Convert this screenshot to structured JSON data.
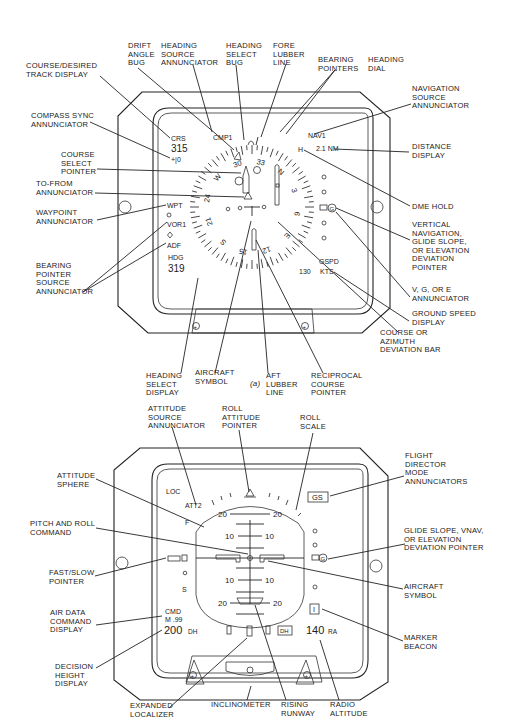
{
  "figure_a": {
    "caption": "(a)",
    "title": "Horizontal Situation Indicator",
    "callouts": [
      {
        "id": "course-desired-track-display",
        "lines": [
          "COURSE/DESIRED",
          "TRACK DISPLAY"
        ]
      },
      {
        "id": "drift-angle-bug",
        "lines": [
          "DRIFT",
          "ANGLE",
          "BUG"
        ]
      },
      {
        "id": "heading-source-annunciator",
        "lines": [
          "HEADING",
          "SOURCE",
          "ANNUNCIATOR"
        ]
      },
      {
        "id": "heading-select-bug",
        "lines": [
          "HEADING",
          "SELECT",
          "BUG"
        ]
      },
      {
        "id": "fore-lubber-line",
        "lines": [
          "FORE",
          "LUBBER",
          "LINE"
        ]
      },
      {
        "id": "bearing-pointers",
        "lines": [
          "BEARING",
          "POINTERS"
        ]
      },
      {
        "id": "heading-dial",
        "lines": [
          "HEADING",
          "DIAL"
        ]
      },
      {
        "id": "navigation-source-annunciator",
        "lines": [
          "NAVIGATION",
          "SOURCE",
          "ANNUNCIATOR"
        ]
      },
      {
        "id": "compass-sync-annunciator",
        "lines": [
          "COMPASS SYNC",
          "ANNUNCIATOR"
        ]
      },
      {
        "id": "course-select-pointer",
        "lines": [
          "COURSE",
          "SELECT",
          "POINTER"
        ]
      },
      {
        "id": "to-from-annunciator",
        "lines": [
          "TO-FROM",
          "ANNUNCIATOR"
        ]
      },
      {
        "id": "waypoint-annunciator",
        "lines": [
          "WAYPOINT",
          "ANNUNCIATOR"
        ]
      },
      {
        "id": "bearing-pointer-source-annunciator",
        "lines": [
          "BEARING",
          "POINTER",
          "SOURCE",
          "ANNUNCIATOR"
        ]
      },
      {
        "id": "distance-display",
        "lines": [
          "DISTANCE",
          "DISPLAY"
        ]
      },
      {
        "id": "dme-hold",
        "lines": [
          "DME HOLD"
        ]
      },
      {
        "id": "vertical-navigation",
        "lines": [
          "VERTICAL",
          "NAVIGATION,",
          "GLIDE SLOPE,",
          "OR ELEVATION",
          "DEVIATION",
          "POINTER"
        ]
      },
      {
        "id": "vge-annunciator",
        "lines": [
          "V, G, OR E",
          "ANNUNCIATOR"
        ]
      },
      {
        "id": "ground-speed-display",
        "lines": [
          "GROUND SPEED",
          "DISPLAY"
        ]
      },
      {
        "id": "course-azimuth-deviation-bar",
        "lines": [
          "COURSE OR",
          "AZIMUTH",
          "DEVIATION BAR"
        ]
      },
      {
        "id": "heading-select-display",
        "lines": [
          "HEADING",
          "SELECT",
          "DISPLAY"
        ]
      },
      {
        "id": "aircraft-symbol",
        "lines": [
          "AIRCRAFT",
          "SYMBOL"
        ]
      },
      {
        "id": "aft-lubber-line",
        "lines": [
          "AFT",
          "LUBBER",
          "LINE"
        ]
      },
      {
        "id": "reciprocal-course-pointer",
        "lines": [
          "RECIPROCAL",
          "COURSE",
          "POINTER"
        ]
      }
    ],
    "displays": {
      "crs_label": "CRS",
      "crs_value": "315",
      "sync": "+|0",
      "cmp": "CMP1",
      "nav": "NAV1",
      "distance": "2.1 NM",
      "dme_hold": "H",
      "wpt": "WPT",
      "vor": "VOR1",
      "adf": "ADF",
      "hdg_label": "HDG",
      "hdg_value": "319",
      "gspd_label": "GSPD",
      "gspd_value": "130",
      "gspd_unit": "KTS",
      "vge": "G"
    },
    "dial_labels": [
      "30",
      "33",
      "N",
      "3",
      "6",
      "E",
      "12",
      "15",
      "S",
      "21",
      "24",
      "W"
    ]
  },
  "figure_b": {
    "title": "Attitude Director Indicator",
    "callouts": [
      {
        "id": "attitude-source-annunciator",
        "lines": [
          "ATTITUDE",
          "SOURCE",
          "ANNUNCIATOR"
        ]
      },
      {
        "id": "roll-attitude-pointer",
        "lines": [
          "ROLL",
          "ATTITUDE",
          "POINTER"
        ]
      },
      {
        "id": "roll-scale",
        "lines": [
          "ROLL",
          "SCALE"
        ]
      },
      {
        "id": "flight-director-mode-annunciators",
        "lines": [
          "FLIGHT",
          "DIRECTOR",
          "MODE",
          "ANNUNCIATORS"
        ]
      },
      {
        "id": "attitude-sphere",
        "lines": [
          "ATTITUDE",
          "SPHERE"
        ]
      },
      {
        "id": "pitch-and-roll-command",
        "lines": [
          "PITCH AND ROLL",
          "COMMAND"
        ]
      },
      {
        "id": "glide-slope-vnav",
        "lines": [
          "GLIDE SLOPE, VNAV,",
          "OR ELEVATION",
          "DEVIATION POINTER"
        ]
      },
      {
        "id": "fast-slow-pointer",
        "lines": [
          "FAST/SLOW",
          "POINTER"
        ]
      },
      {
        "id": "aircraft-symbol-b",
        "lines": [
          "AIRCRAFT",
          "SYMBOL"
        ]
      },
      {
        "id": "air-data-command-display",
        "lines": [
          "AIR DATA",
          "COMMAND",
          "DISPLAY"
        ]
      },
      {
        "id": "marker-beacon",
        "lines": [
          "MARKER",
          "BEACON"
        ]
      },
      {
        "id": "decision-height-display",
        "lines": [
          "DECISION",
          "HEIGHT",
          "DISPLAY"
        ]
      },
      {
        "id": "expanded-localizer",
        "lines": [
          "EXPANDED",
          "LOCALIZER"
        ]
      },
      {
        "id": "inclinometer",
        "lines": [
          "INCLINOMETER"
        ]
      },
      {
        "id": "rising-runway",
        "lines": [
          "RISING",
          "RUNWAY"
        ]
      },
      {
        "id": "radio-altitude",
        "lines": [
          "RADIO",
          "ALTITUDE"
        ]
      }
    ],
    "displays": {
      "loc": "LOC",
      "att": "ATT2",
      "fd_mode": "GS",
      "pitch_20": "20",
      "pitch_10": "10",
      "cmd_label": "CMD",
      "mach": "M .99",
      "dh_value": "200",
      "dh_unit": "DH",
      "dh_box": "DH",
      "ra_value": "140",
      "ra_unit": "RA",
      "marker": "I",
      "gs": "G",
      "speed_f": "F",
      "speed_s": "S"
    }
  }
}
